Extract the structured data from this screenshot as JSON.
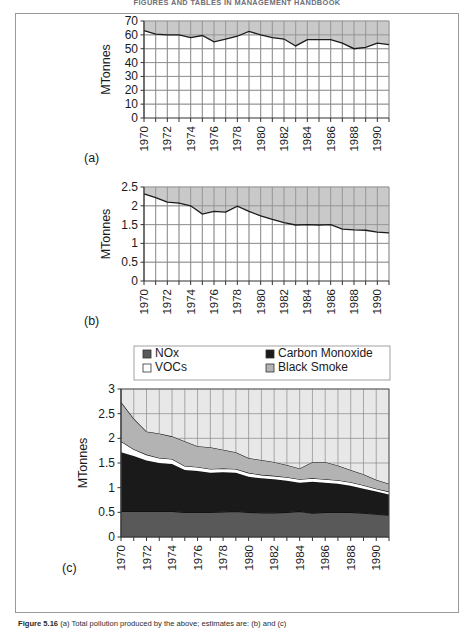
{
  "running_head": "FIGURES AND TABLES IN MANAGEMENT HANDBOOK",
  "figure": {
    "caption_label": "Figure 5.16",
    "caption_text": "(a) Total pollution produced by the above; estimates are: (b) and (c)"
  },
  "axis": {
    "ylabel": "MTonnes",
    "xtick_labels": [
      "1970",
      "1972",
      "1974",
      "1976",
      "1978",
      "1980",
      "1982",
      "1984",
      "1986",
      "1988",
      "1990"
    ],
    "years_all": [
      1970,
      1971,
      1972,
      1973,
      1974,
      1975,
      1976,
      1977,
      1978,
      1979,
      1980,
      1981,
      1982,
      1983,
      1984,
      1985,
      1986,
      1987,
      1988,
      1989,
      1990,
      1991
    ]
  },
  "panel_labels": {
    "a": "(a)",
    "b": "(b)",
    "c": "(c)"
  },
  "legend": {
    "items": [
      {
        "label": "NOx",
        "color": "#595959"
      },
      {
        "label": "Carbon Monoxide",
        "color": "#1a1a1a"
      },
      {
        "label": "VOCs",
        "color": "#ffffff"
      },
      {
        "label": "Black Smoke",
        "color": "#b3b3b3"
      }
    ]
  },
  "colors": {
    "fill_gray": "#c0c0c0",
    "line": "#1a1a1a",
    "grid": "#8a8a8a",
    "axis": "#333333",
    "nox": "#595959",
    "carbon_monoxide": "#1a1a1a",
    "vocs": "#ffffff",
    "black_smoke": "#b3b3b3"
  },
  "chart_data": [
    {
      "id": "panel-a",
      "type": "area",
      "title": "",
      "panel": "(a)",
      "xlabel": "",
      "ylabel": "MTonnes",
      "ylim": [
        0,
        70
      ],
      "yticks": [
        0,
        10,
        20,
        30,
        40,
        50,
        60,
        70
      ],
      "xlim": [
        1970,
        1991
      ],
      "grid": true,
      "fill_above": true,
      "categories": [
        1970,
        1971,
        1972,
        1973,
        1974,
        1975,
        1976,
        1977,
        1978,
        1979,
        1980,
        1981,
        1982,
        1983,
        1984,
        1985,
        1986,
        1987,
        1988,
        1989,
        1990,
        1991
      ],
      "values": [
        63,
        60.5,
        60,
        60,
        58,
        59.5,
        55,
        57,
        59,
        62.5,
        60,
        58,
        57,
        52,
        56.5,
        56.5,
        56.5,
        54,
        50,
        51,
        54,
        53
      ]
    },
    {
      "id": "panel-b",
      "type": "area",
      "title": "",
      "panel": "(b)",
      "xlabel": "",
      "ylabel": "MTonnes",
      "ylim": [
        0,
        2.5
      ],
      "yticks": [
        0,
        0.5,
        1,
        1.5,
        2,
        2.5
      ],
      "xlim": [
        1970,
        1991
      ],
      "grid": true,
      "fill_above": true,
      "categories": [
        1970,
        1971,
        1972,
        1973,
        1974,
        1975,
        1976,
        1977,
        1978,
        1979,
        1980,
        1981,
        1982,
        1983,
        1984,
        1985,
        1986,
        1987,
        1988,
        1989,
        1990,
        1991
      ],
      "values": [
        2.32,
        2.22,
        2.1,
        2.07,
        2.0,
        1.78,
        1.85,
        1.83,
        1.99,
        1.85,
        1.73,
        1.64,
        1.55,
        1.49,
        1.5,
        1.49,
        1.5,
        1.38,
        1.36,
        1.35,
        1.3,
        1.28
      ]
    },
    {
      "id": "panel-c",
      "type": "area",
      "stacked": true,
      "title": "",
      "panel": "(c)",
      "xlabel": "",
      "ylabel": "MTonnes",
      "ylim": [
        0,
        3
      ],
      "yticks": [
        0,
        0.5,
        1,
        1.5,
        2,
        2.5,
        3
      ],
      "xlim": [
        1970,
        1991
      ],
      "grid": true,
      "legend_position": "top",
      "categories": [
        1970,
        1971,
        1972,
        1973,
        1974,
        1975,
        1976,
        1977,
        1978,
        1979,
        1980,
        1981,
        1982,
        1983,
        1984,
        1985,
        1986,
        1987,
        1988,
        1989,
        1990,
        1991
      ],
      "series": [
        {
          "name": "NOx",
          "color": "#595959",
          "values": [
            0.52,
            0.52,
            0.52,
            0.52,
            0.52,
            0.5,
            0.5,
            0.5,
            0.51,
            0.52,
            0.5,
            0.49,
            0.49,
            0.5,
            0.52,
            0.48,
            0.5,
            0.5,
            0.5,
            0.48,
            0.46,
            0.44
          ]
        },
        {
          "name": "Carbon Monoxide",
          "color": "#1a1a1a",
          "values": [
            1.2,
            1.12,
            1.03,
            0.98,
            0.96,
            0.86,
            0.84,
            0.8,
            0.8,
            0.78,
            0.72,
            0.7,
            0.68,
            0.64,
            0.58,
            0.64,
            0.6,
            0.58,
            0.54,
            0.5,
            0.46,
            0.42
          ]
        },
        {
          "name": "VOCs",
          "color": "#ffffff",
          "values": [
            0.22,
            0.14,
            0.12,
            0.1,
            0.1,
            0.08,
            0.08,
            0.08,
            0.08,
            0.08,
            0.08,
            0.07,
            0.07,
            0.07,
            0.07,
            0.07,
            0.07,
            0.07,
            0.07,
            0.07,
            0.06,
            0.06
          ]
        },
        {
          "name": "Black Smoke",
          "color": "#b3b3b3",
          "values": [
            0.8,
            0.62,
            0.47,
            0.5,
            0.46,
            0.5,
            0.42,
            0.44,
            0.38,
            0.34,
            0.3,
            0.3,
            0.28,
            0.25,
            0.22,
            0.33,
            0.35,
            0.3,
            0.25,
            0.22,
            0.18,
            0.16
          ]
        }
      ]
    }
  ]
}
